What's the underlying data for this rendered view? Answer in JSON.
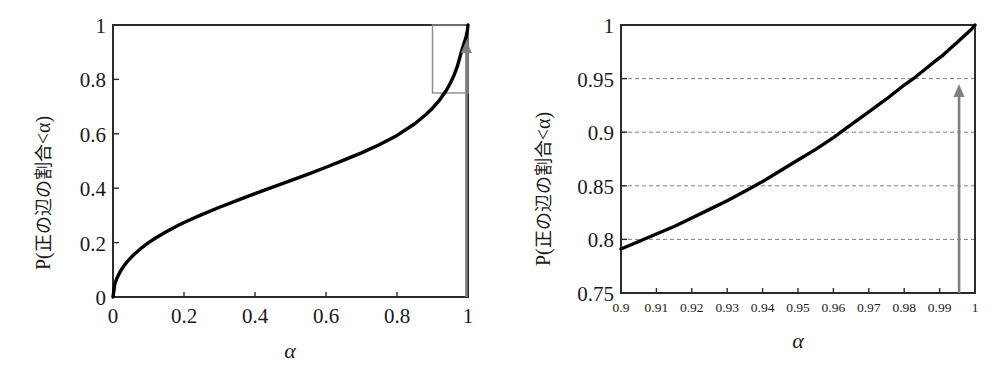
{
  "figure": {
    "background_color": "#ffffff",
    "curve_color": "#000000",
    "frame_color": "#2b2b2b",
    "arrow_color": "#808080",
    "inset_box_color": "#8c8c8c",
    "grid_color": "#808080"
  },
  "panels": [
    {
      "id": "left",
      "name": "full-range-panel",
      "ylabel": "P(正の辺の割合<α)",
      "ylabel_prefix": "P(",
      "ylabel_cjk": "正の辺の割合",
      "ylabel_suffix": "<α)",
      "xlabel": "α",
      "xticks": [
        "0",
        "0.2",
        "0.4",
        "0.6",
        "0.8",
        "1"
      ],
      "xtick_values": [
        0,
        0.2,
        0.4,
        0.6,
        0.8,
        1
      ],
      "yticks": [
        "0",
        "0.2",
        "0.4",
        "0.6",
        "0.8",
        "1"
      ],
      "ytick_values": [
        0,
        0.2,
        0.4,
        0.6,
        0.8,
        1
      ],
      "xlim": [
        0,
        1
      ],
      "ylim": [
        0,
        1
      ],
      "grid": false,
      "inset_box": {
        "x0": 0.9,
        "x1": 1.0,
        "y0": 0.75,
        "y1": 1.0
      },
      "arrow": {
        "x": 0.9955,
        "y_from": 0.0,
        "y_to": 0.945
      }
    },
    {
      "id": "right",
      "name": "zoomed-panel",
      "ylabel": "P(正の辺の割合<α)",
      "ylabel_prefix": "P(",
      "ylabel_cjk": "正の辺の割合",
      "ylabel_suffix": "<α)",
      "xlabel": "α",
      "xticks": [
        "0.9",
        "0.91",
        "0.92",
        "0.93",
        "0.94",
        "0.95",
        "0.96",
        "0.97",
        "0.98",
        "0.99",
        "1"
      ],
      "xtick_values": [
        0.9,
        0.91,
        0.92,
        0.93,
        0.94,
        0.95,
        0.96,
        0.97,
        0.98,
        0.99,
        1
      ],
      "yticks": [
        "0.75",
        "0.8",
        "0.85",
        "0.9",
        "0.95",
        "1"
      ],
      "ytick_values": [
        0.75,
        0.8,
        0.85,
        0.9,
        0.95,
        1
      ],
      "xlim": [
        0.9,
        1
      ],
      "ylim": [
        0.75,
        1
      ],
      "grid": true,
      "gridlines_y": [
        0.8,
        0.85,
        0.9,
        0.95
      ],
      "arrow": {
        "x": 0.9955,
        "y_from": 0.75,
        "y_to": 0.945
      }
    }
  ],
  "chart_data": {
    "type": "line",
    "title": "",
    "n_panels": 2,
    "panel_left": {
      "xlabel": "α",
      "ylabel": "P(正の辺の割合<α)",
      "xlim": [
        0,
        1
      ],
      "ylim": [
        0,
        1
      ],
      "grid": false,
      "series": [
        {
          "name": "P(positive edge fraction < alpha)",
          "x": [
            0.0,
            0.005,
            0.01,
            0.02,
            0.03,
            0.04,
            0.05,
            0.06,
            0.08,
            0.1,
            0.12,
            0.15,
            0.18,
            0.2,
            0.25,
            0.3,
            0.35,
            0.4,
            0.45,
            0.5,
            0.55,
            0.6,
            0.65,
            0.7,
            0.75,
            0.8,
            0.85,
            0.88,
            0.9,
            0.92,
            0.94,
            0.95,
            0.96,
            0.97,
            0.98,
            0.985,
            0.99,
            0.995,
            0.998,
            1.0
          ],
          "y": [
            0.0,
            0.047,
            0.066,
            0.093,
            0.113,
            0.13,
            0.144,
            0.157,
            0.18,
            0.2,
            0.217,
            0.24,
            0.261,
            0.274,
            0.303,
            0.33,
            0.355,
            0.38,
            0.404,
            0.428,
            0.452,
            0.477,
            0.503,
            0.53,
            0.56,
            0.594,
            0.637,
            0.669,
            0.694,
            0.724,
            0.762,
            0.786,
            0.813,
            0.848,
            0.895,
            0.917,
            0.937,
            0.959,
            0.978,
            1.0
          ]
        }
      ],
      "annotations": [
        {
          "type": "rect",
          "label": "zoom-region-box",
          "x0": 0.9,
          "x1": 1.0,
          "y0": 0.75,
          "y1": 1.0
        },
        {
          "type": "arrow",
          "label": "threshold-arrow",
          "x": 0.9955,
          "y_from": 0.0,
          "y_to": 0.945
        }
      ]
    },
    "panel_right": {
      "xlabel": "α",
      "ylabel": "P(正の辺の割合<α)",
      "xlim": [
        0.9,
        1.0
      ],
      "ylim": [
        0.75,
        1.0
      ],
      "grid": true,
      "gridlines_y": [
        0.8,
        0.85,
        0.9,
        0.95
      ],
      "series": [
        {
          "name": "P(positive edge fraction < alpha)",
          "x": [
            0.9,
            0.905,
            0.91,
            0.915,
            0.92,
            0.925,
            0.93,
            0.935,
            0.94,
            0.945,
            0.95,
            0.955,
            0.96,
            0.965,
            0.97,
            0.975,
            0.98,
            0.983,
            0.986,
            0.989,
            0.991,
            0.993,
            0.995,
            0.996,
            0.997,
            0.998,
            0.999,
            1.0
          ],
          "y": [
            0.791,
            0.798,
            0.805,
            0.812,
            0.82,
            0.828,
            0.836,
            0.845,
            0.854,
            0.864,
            0.874,
            0.884,
            0.895,
            0.907,
            0.919,
            0.931,
            0.944,
            0.951,
            0.959,
            0.967,
            0.972,
            0.978,
            0.984,
            0.987,
            0.99,
            0.993,
            0.996,
            1.0
          ]
        }
      ],
      "annotations": [
        {
          "type": "arrow",
          "label": "threshold-arrow",
          "x": 0.9955,
          "y_from": 0.75,
          "y_to": 0.945
        }
      ]
    }
  }
}
